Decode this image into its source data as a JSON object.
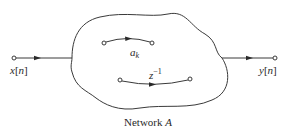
{
  "diagram": {
    "type": "signal-flow-network",
    "caption": {
      "prefix": "Network ",
      "name": "A"
    },
    "input": {
      "label_var": "x",
      "label_index": "n"
    },
    "output": {
      "label_var": "y",
      "label_index": "n"
    },
    "branches": [
      {
        "id": "top",
        "gain_base": "a",
        "gain_sub": "k"
      },
      {
        "id": "bottom",
        "gain_base": "z",
        "gain_sup": "−1"
      }
    ],
    "colors": {
      "stroke": "#3a3a3a",
      "text": "#2a2a2a",
      "background": "#ffffff"
    }
  }
}
